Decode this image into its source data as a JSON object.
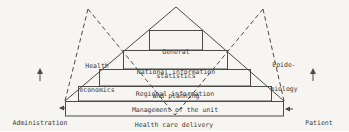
{
  "colors": {
    "background": "#f6f5f1",
    "ink": "#4a4a4a"
  },
  "icons": {
    "up_arrow": "↑",
    "left_arrow": "←"
  },
  "pyramid": {
    "levels": [
      {
        "name": "general-statistics",
        "lines": [
          "General",
          "statistics"
        ]
      },
      {
        "name": "national-information",
        "lines": [
          "National information",
          "and planning"
        ]
      },
      {
        "name": "regional-information",
        "lines": [
          "Regional information"
        ]
      },
      {
        "name": "management-of-the-unit",
        "lines": [
          "Management of the unit"
        ]
      },
      {
        "name": "health-care-delivery",
        "lines": [
          "Health care delivery"
        ]
      }
    ]
  },
  "side_labels": {
    "left_wedge": {
      "lines": [
        "Health",
        "economics"
      ]
    },
    "right_wedge": {
      "lines": [
        "Epide-",
        "miology"
      ]
    },
    "bottom_left": {
      "lines": [
        "Administration",
        "and finance"
      ]
    },
    "bottom_right": {
      "lines": [
        "Patient",
        "administration"
      ]
    }
  }
}
